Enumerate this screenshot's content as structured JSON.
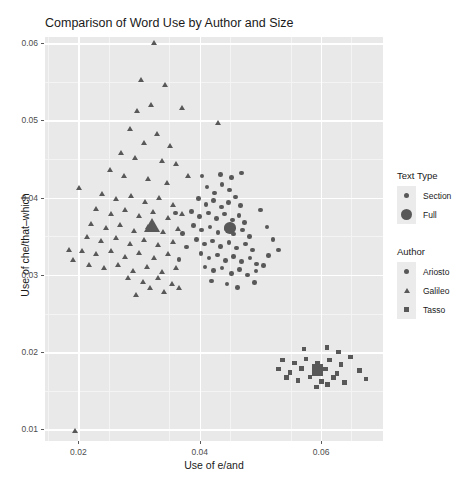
{
  "chart_data": {
    "type": "scatter",
    "title": "Comparison of Word Use by Author and Size",
    "xlabel": "Use of e/and",
    "ylabel": "Use of che/that–which",
    "xlim": [
      0.0145,
      0.0702
    ],
    "ylim": [
      0.0085,
      0.0608
    ],
    "xticks": [
      0.02,
      0.04,
      0.06
    ],
    "xtick_labels": [
      "0.02",
      "0.04",
      "0.06"
    ],
    "yticks": [
      0.01,
      0.02,
      0.03,
      0.04,
      0.05,
      0.06
    ],
    "ytick_labels": [
      "0.01",
      "0.02",
      "0.03",
      "0.04",
      "0.05",
      "0.06"
    ],
    "xminor": [
      0.015,
      0.025,
      0.035,
      0.045,
      0.055,
      0.065
    ],
    "yminor": [
      0.015,
      0.025,
      0.035,
      0.045,
      0.055
    ],
    "grid": true,
    "legend_position": "right",
    "panel_background": "#e9e9e9",
    "grid_color": "#ffffff",
    "marker_color": "#585858",
    "series": [
      {
        "name": "Ariosto",
        "marker": "circle",
        "size": "Section",
        "points": [
          [
            0.0412,
            0.0414
          ],
          [
            0.0424,
            0.0406
          ],
          [
            0.0437,
            0.0417
          ],
          [
            0.0449,
            0.041
          ],
          [
            0.0398,
            0.0399
          ],
          [
            0.041,
            0.0391
          ],
          [
            0.0423,
            0.0396
          ],
          [
            0.0436,
            0.0388
          ],
          [
            0.0447,
            0.0394
          ],
          [
            0.0459,
            0.0401
          ],
          [
            0.0467,
            0.039
          ],
          [
            0.0386,
            0.0382
          ],
          [
            0.04,
            0.0376
          ],
          [
            0.0414,
            0.038
          ],
          [
            0.0428,
            0.0373
          ],
          [
            0.0441,
            0.0379
          ],
          [
            0.0454,
            0.0371
          ],
          [
            0.0465,
            0.0377
          ],
          [
            0.0474,
            0.0368
          ],
          [
            0.039,
            0.0364
          ],
          [
            0.0403,
            0.0358
          ],
          [
            0.0417,
            0.0362
          ],
          [
            0.043,
            0.0355
          ],
          [
            0.0443,
            0.036
          ],
          [
            0.0456,
            0.0353
          ],
          [
            0.047,
            0.0358
          ],
          [
            0.0482,
            0.035
          ],
          [
            0.0395,
            0.0346
          ],
          [
            0.0408,
            0.034
          ],
          [
            0.0421,
            0.0344
          ],
          [
            0.0434,
            0.0337
          ],
          [
            0.0448,
            0.0342
          ],
          [
            0.0461,
            0.0335
          ],
          [
            0.0475,
            0.034
          ],
          [
            0.0487,
            0.0332
          ],
          [
            0.0402,
            0.0328
          ],
          [
            0.0415,
            0.0322
          ],
          [
            0.0429,
            0.0326
          ],
          [
            0.0442,
            0.0319
          ],
          [
            0.0456,
            0.0324
          ],
          [
            0.0469,
            0.0317
          ],
          [
            0.0483,
            0.0322
          ],
          [
            0.0494,
            0.0314
          ],
          [
            0.0409,
            0.031
          ],
          [
            0.0423,
            0.0306
          ],
          [
            0.0437,
            0.0309
          ],
          [
            0.0452,
            0.0302
          ],
          [
            0.0466,
            0.0307
          ],
          [
            0.0479,
            0.03
          ],
          [
            0.0493,
            0.0305
          ],
          [
            0.0505,
            0.0312
          ],
          [
            0.0513,
            0.0325
          ],
          [
            0.036,
            0.038
          ],
          [
            0.0372,
            0.0354
          ],
          [
            0.0378,
            0.0336
          ],
          [
            0.0366,
            0.032
          ],
          [
            0.05,
            0.0384
          ],
          [
            0.0511,
            0.0362
          ],
          [
            0.0521,
            0.0346
          ],
          [
            0.053,
            0.0332
          ],
          [
            0.0445,
            0.0288
          ],
          [
            0.0462,
            0.0284
          ],
          [
            0.0419,
            0.0292
          ],
          [
            0.049,
            0.029
          ],
          [
            0.0434,
            0.043
          ],
          [
            0.0452,
            0.0426
          ],
          [
            0.0469,
            0.0432
          ],
          [
            0.0404,
            0.0428
          ]
        ]
      },
      {
        "name": "Galileo",
        "marker": "triangle",
        "size": "Section",
        "points": [
          [
            0.0326,
            0.06
          ],
          [
            0.0303,
            0.0552
          ],
          [
            0.0343,
            0.0545
          ],
          [
            0.032,
            0.052
          ],
          [
            0.0297,
            0.0512
          ],
          [
            0.0372,
            0.0516
          ],
          [
            0.0431,
            0.0496
          ],
          [
            0.0286,
            0.0489
          ],
          [
            0.033,
            0.0482
          ],
          [
            0.0308,
            0.047
          ],
          [
            0.0352,
            0.0466
          ],
          [
            0.0271,
            0.0458
          ],
          [
            0.0294,
            0.0451
          ],
          [
            0.0338,
            0.0447
          ],
          [
            0.0361,
            0.0443
          ],
          [
            0.0252,
            0.0435
          ],
          [
            0.0276,
            0.0428
          ],
          [
            0.0316,
            0.0424
          ],
          [
            0.0347,
            0.0419
          ],
          [
            0.0382,
            0.0428
          ],
          [
            0.0201,
            0.0412
          ],
          [
            0.0239,
            0.0404
          ],
          [
            0.0263,
            0.0398
          ],
          [
            0.0287,
            0.0402
          ],
          [
            0.031,
            0.0394
          ],
          [
            0.0333,
            0.0399
          ],
          [
            0.0357,
            0.039
          ],
          [
            0.023,
            0.0385
          ],
          [
            0.0254,
            0.0379
          ],
          [
            0.0278,
            0.0383
          ],
          [
            0.0301,
            0.0376
          ],
          [
            0.0324,
            0.0381
          ],
          [
            0.0348,
            0.0373
          ],
          [
            0.0372,
            0.0378
          ],
          [
            0.0222,
            0.0366
          ],
          [
            0.0246,
            0.036
          ],
          [
            0.0269,
            0.0364
          ],
          [
            0.0293,
            0.0357
          ],
          [
            0.0316,
            0.0362
          ],
          [
            0.034,
            0.0355
          ],
          [
            0.0364,
            0.0359
          ],
          [
            0.0214,
            0.0348
          ],
          [
            0.0238,
            0.0343
          ],
          [
            0.0262,
            0.0347
          ],
          [
            0.0285,
            0.034
          ],
          [
            0.0309,
            0.0345
          ],
          [
            0.0332,
            0.0338
          ],
          [
            0.0356,
            0.0342
          ],
          [
            0.0206,
            0.0331
          ],
          [
            0.023,
            0.0326
          ],
          [
            0.0254,
            0.033
          ],
          [
            0.0277,
            0.0323
          ],
          [
            0.0301,
            0.0328
          ],
          [
            0.0325,
            0.0321
          ],
          [
            0.0349,
            0.0326
          ],
          [
            0.0185,
            0.0332
          ],
          [
            0.0192,
            0.0319
          ],
          [
            0.0218,
            0.0313
          ],
          [
            0.0242,
            0.0308
          ],
          [
            0.0266,
            0.0312
          ],
          [
            0.029,
            0.0305
          ],
          [
            0.0314,
            0.031
          ],
          [
            0.0338,
            0.0303
          ],
          [
            0.0362,
            0.0308
          ],
          [
            0.0283,
            0.0296
          ],
          [
            0.0307,
            0.0291
          ],
          [
            0.0331,
            0.0295
          ],
          [
            0.0355,
            0.0288
          ],
          [
            0.0318,
            0.0282
          ],
          [
            0.0342,
            0.0278
          ],
          [
            0.0366,
            0.0283
          ],
          [
            0.0296,
            0.0274
          ],
          [
            0.0195,
            0.0098
          ]
        ]
      },
      {
        "name": "Tasso",
        "marker": "square",
        "size": "Section",
        "points": [
          [
            0.0572,
            0.0204
          ],
          [
            0.061,
            0.0206
          ],
          [
            0.0629,
            0.02
          ],
          [
            0.0648,
            0.0194
          ],
          [
            0.0536,
            0.019
          ],
          [
            0.0556,
            0.0186
          ],
          [
            0.0575,
            0.0191
          ],
          [
            0.0594,
            0.0185
          ],
          [
            0.0614,
            0.019
          ],
          [
            0.0633,
            0.0184
          ],
          [
            0.053,
            0.0178
          ],
          [
            0.0549,
            0.0174
          ],
          [
            0.0568,
            0.0179
          ],
          [
            0.0588,
            0.0173
          ],
          [
            0.0607,
            0.0178
          ],
          [
            0.0626,
            0.0172
          ],
          [
            0.0663,
            0.0176
          ],
          [
            0.0543,
            0.0167
          ],
          [
            0.0562,
            0.0163
          ],
          [
            0.0582,
            0.0168
          ],
          [
            0.0601,
            0.0162
          ],
          [
            0.062,
            0.0167
          ],
          [
            0.0639,
            0.0161
          ],
          [
            0.0674,
            0.0165
          ],
          [
            0.0592,
            0.0155
          ],
          [
            0.0611,
            0.0158
          ]
        ]
      }
    ],
    "centroids": [
      {
        "name": "Ariosto",
        "marker": "circle",
        "size": "Full",
        "point": [
          0.045,
          0.0361
        ]
      },
      {
        "name": "Galileo",
        "marker": "triangle",
        "size": "Full",
        "point": [
          0.0323,
          0.0363
        ]
      },
      {
        "name": "Tasso",
        "marker": "square",
        "size": "Full",
        "point": [
          0.0594,
          0.0177
        ]
      }
    ]
  },
  "legend": {
    "size_title": "Text Type",
    "size_items": [
      {
        "label": "Section",
        "marker": "circle",
        "scale": "small"
      },
      {
        "label": "Full",
        "marker": "circle",
        "scale": "large"
      }
    ],
    "author_title": "Author",
    "author_items": [
      {
        "label": "Ariosto",
        "marker": "circle"
      },
      {
        "label": "Galileo",
        "marker": "triangle"
      },
      {
        "label": "Tasso",
        "marker": "square"
      }
    ]
  }
}
